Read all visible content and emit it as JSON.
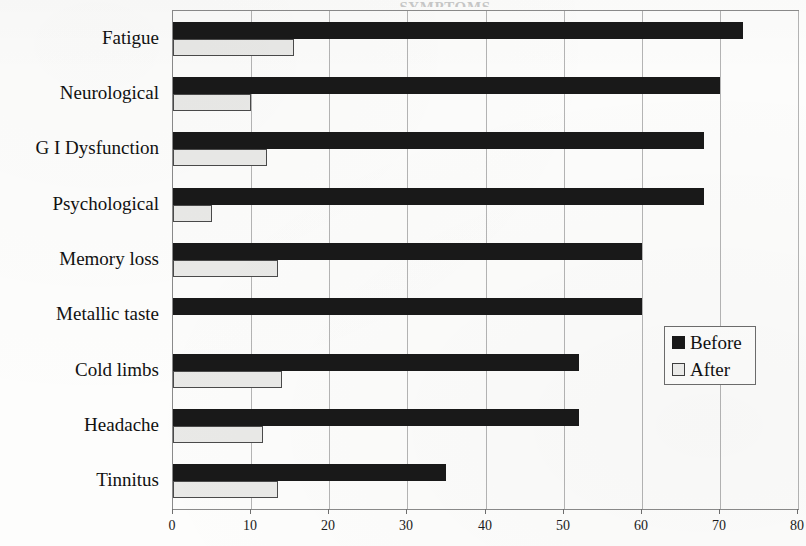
{
  "title_sliver": "SYMPTOMS",
  "chart_data": {
    "type": "bar",
    "orientation": "horizontal",
    "title": "",
    "xlabel": "",
    "ylabel": "",
    "xlim": [
      0,
      80
    ],
    "xticks": [
      0,
      10,
      20,
      30,
      40,
      50,
      60,
      70,
      80
    ],
    "xtick_labels": [
      "0",
      "10",
      "20",
      "30",
      "40",
      "50",
      "60",
      "70",
      "80"
    ],
    "grid": true,
    "grid_axis": "x",
    "legend_position": "right-middle",
    "categories": [
      "Fatigue",
      "Neurological",
      "G I Dysfunction",
      "Psychological",
      "Memory loss",
      "Metallic taste",
      "Cold limbs",
      "Headache",
      "Tinnitus"
    ],
    "series": [
      {
        "name": "Before",
        "color": "#191919",
        "values": [
          73,
          70,
          68,
          68,
          60,
          60,
          52,
          52,
          35
        ]
      },
      {
        "name": "After",
        "color": "#e9e9e7",
        "values": [
          15.5,
          10,
          12,
          5,
          13.5,
          0,
          14,
          11.5,
          13.5
        ]
      }
    ]
  },
  "legend": {
    "entries": [
      {
        "label": "Before",
        "swatch": "before"
      },
      {
        "label": "After",
        "swatch": "after"
      }
    ]
  }
}
